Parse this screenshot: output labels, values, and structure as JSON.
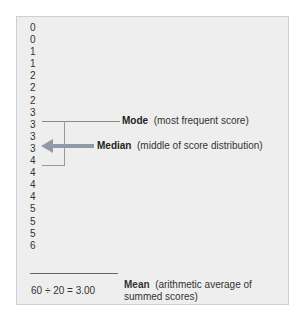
{
  "scores": [
    "0",
    "0",
    "1",
    "1",
    "2",
    "2",
    "2",
    "3",
    "3",
    "3",
    "3",
    "4",
    "4",
    "4",
    "4",
    "5",
    "5",
    "5",
    "6"
  ],
  "mode": {
    "term": "Mode",
    "description": "(most frequent score)"
  },
  "median": {
    "term": "Median",
    "description": "(middle of score distribution)"
  },
  "mean": {
    "formula": "60 ÷ 20 = 3.00",
    "term": "Mean",
    "description": "(arithmetic average of summed scores)"
  },
  "colors": {
    "panel_bg": "#eeeeee",
    "arrow": "#8f9aa8",
    "line": "#888888"
  }
}
